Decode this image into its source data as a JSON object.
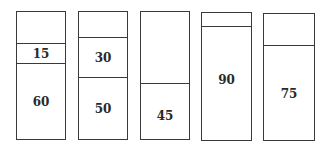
{
  "diagram": {
    "total_per_box": 100,
    "boxes": [
      {
        "segments": [
          {
            "value": 60,
            "label": "60"
          },
          {
            "value": 15,
            "label": "15"
          }
        ]
      },
      {
        "segments": [
          {
            "value": 50,
            "label": "50"
          },
          {
            "value": 30,
            "label": "30"
          }
        ]
      },
      {
        "segments": [
          {
            "value": 45,
            "label": "45"
          }
        ]
      },
      {
        "segments": [
          {
            "value": 90,
            "label": "90"
          }
        ]
      },
      {
        "segments": [
          {
            "value": 75,
            "label": "75"
          }
        ]
      }
    ]
  },
  "colors": {
    "stroke": "#3a3a3a",
    "text": "#2a2a2a",
    "background": "#ffffff"
  }
}
